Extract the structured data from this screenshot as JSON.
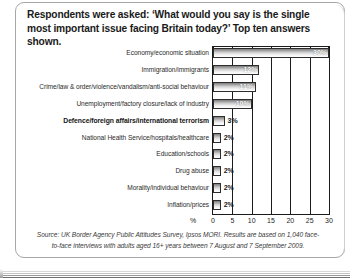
{
  "title": "Respondents were asked: ‘What would you say is the single most important issue facing Britain today?’ Top ten answers shown.",
  "source": "Source: UK Border Agency Public Attitudes Survey, Ipsos MORI. Results are based on 1,040 face-to-face interviews with adults aged 16+ years between 7 August and 7 September 2009.",
  "axis": {
    "unit_label": "%",
    "ticks": [
      "0",
      "5",
      "10",
      "15",
      "20",
      "25",
      "30"
    ]
  },
  "colors": {
    "bar_dark": "#7d7d7d",
    "bar_light": "#ffffff",
    "bar_outline": "#2d2d2d",
    "axis": "#1b1b1b",
    "text": "#231f20"
  },
  "chart_data": {
    "type": "bar",
    "orientation": "horizontal",
    "title": "Respondents were asked: ‘What would you say is the single most important issue facing Britain today?’ Top ten answers shown.",
    "xlabel": "%",
    "ylabel": "",
    "xlim": [
      0,
      30
    ],
    "grid": true,
    "legend": null,
    "categories": [
      "Economy/economic situation",
      "Immigration/immigrants",
      "Crime/law & order/violence/vandalism/anti-social behaviour",
      "Unemployment/factory closure/lack of industry",
      "Defence/foreign affairs/international terrorism",
      "National Health Service/hospitals/healthcare",
      "Education/schools",
      "Drug abuse",
      "Morality/individual behaviour",
      "Inflation/prices"
    ],
    "values": [
      30,
      12,
      11,
      10,
      3,
      2,
      2,
      2,
      2,
      2
    ],
    "data_labels": [
      "30%",
      "12%",
      "11%",
      "10%",
      "3%",
      "2%",
      "2%",
      "2%",
      "2%",
      "2%"
    ],
    "emphasis_index": 4
  }
}
